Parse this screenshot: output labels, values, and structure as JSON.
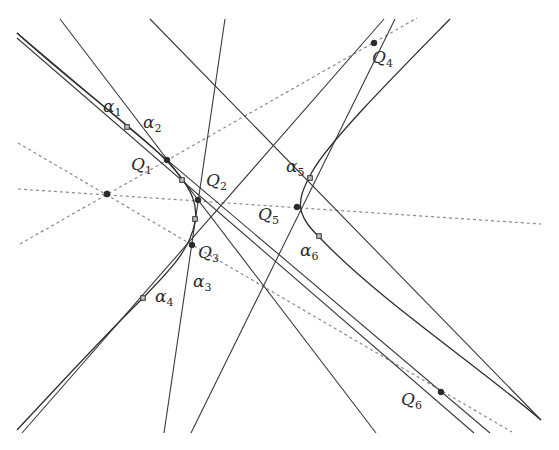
{
  "diagram": {
    "width": 559,
    "height": 450,
    "colors": {
      "solid": "#3a3a3a",
      "dashed": "#8a8a8a",
      "curve": "#2e2e2e",
      "point": "#2a2a2a"
    },
    "hub_point": {
      "x": 107,
      "y": 194
    },
    "points_Q": [
      {
        "name": "Q",
        "sub": "1",
        "x": 167,
        "y": 160,
        "lx": 131,
        "ly": 170
      },
      {
        "name": "Q",
        "sub": "2",
        "x": 198,
        "y": 200,
        "lx": 206,
        "ly": 186
      },
      {
        "name": "Q",
        "sub": "3",
        "x": 192,
        "y": 245,
        "lx": 198,
        "ly": 258
      },
      {
        "name": "Q",
        "sub": "4",
        "x": 374,
        "y": 43,
        "lx": 372,
        "ly": 63
      },
      {
        "name": "Q",
        "sub": "5",
        "x": 297,
        "y": 207,
        "lx": 258,
        "ly": 220
      },
      {
        "name": "Q",
        "sub": "6",
        "x": 441,
        "y": 392,
        "lx": 401,
        "ly": 405
      }
    ],
    "points_alpha": [
      {
        "name": "α",
        "sub": "1",
        "x": 127,
        "y": 127,
        "lx": 103,
        "ly": 112
      },
      {
        "name": "α",
        "sub": "2",
        "x": 182,
        "y": 180,
        "lx": 143,
        "ly": 128
      },
      {
        "name": "α",
        "sub": "3",
        "x": 195,
        "y": 219,
        "lx": 193,
        "ly": 287
      },
      {
        "name": "α",
        "sub": "4",
        "x": 143,
        "y": 298,
        "lx": 155,
        "ly": 302
      },
      {
        "name": "α",
        "sub": "5",
        "x": 310,
        "y": 178,
        "lx": 286,
        "ly": 172
      },
      {
        "name": "α",
        "sub": "6",
        "x": 319,
        "y": 236,
        "lx": 300,
        "ly": 256
      }
    ],
    "dashed_lines": [
      {
        "x1": 20,
        "y1": 244,
        "x2": 417,
        "y2": 18
      },
      {
        "x1": 18,
        "y1": 189,
        "x2": 541,
        "y2": 224
      },
      {
        "x1": 18,
        "y1": 143,
        "x2": 512,
        "y2": 432
      }
    ],
    "solid_lines": [
      {
        "x1": 17,
        "y1": 33,
        "x2": 490,
        "y2": 433
      },
      {
        "x1": 60,
        "y1": 19,
        "x2": 376,
        "y2": 433
      },
      {
        "x1": 150,
        "y1": 19,
        "x2": 541,
        "y2": 420
      },
      {
        "x1": 225,
        "y1": 19,
        "x2": 164,
        "y2": 433
      },
      {
        "x1": 395,
        "y1": 19,
        "x2": 191,
        "y2": 433
      },
      {
        "x1": 384,
        "y1": 19,
        "x2": 22,
        "y2": 433
      },
      {
        "x1": 17,
        "y1": 38,
        "x2": 474,
        "y2": 433
      }
    ],
    "curves": [
      {
        "id": "left-branch",
        "d": "M17,33 C80,90 150,140 175,170 C192,190 198,205 195,222 C190,250 170,270 143,298 C100,340 50,395 17,430"
      },
      {
        "id": "right-branch",
        "d": "M450,19 C400,70 330,140 312,172 C302,190 299,200 301,210 C304,222 312,230 322,240 C380,300 470,360 541,420"
      }
    ]
  }
}
